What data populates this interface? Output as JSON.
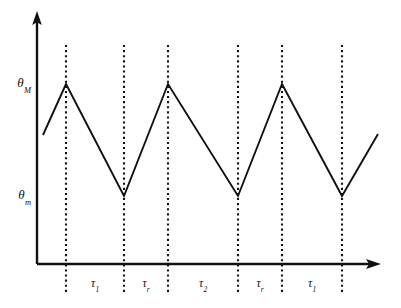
{
  "figure": {
    "background_color": "#ffffff",
    "ink_color": "#111111",
    "width": 401,
    "height": 308
  },
  "axes": {
    "y_axis": {
      "name": "vertical-axis",
      "has_arrow": true,
      "x": 37,
      "y_top": 12,
      "y_bottom": 264
    },
    "x_axis": {
      "name": "horizontal-axis",
      "has_arrow": true,
      "y": 264,
      "x_left": 37,
      "x_right": 380
    },
    "y_tick_labels": [
      {
        "text": "θ",
        "subscript": "M",
        "value_y": 84
      },
      {
        "text": "θ",
        "subscript": "m",
        "value_y": 196
      }
    ]
  },
  "gridlines": {
    "style": "dotted",
    "y_top": 45,
    "y_bottom": 292,
    "x_positions": [
      66,
      124,
      168,
      238,
      282,
      342
    ]
  },
  "interval_labels": [
    {
      "text": "τ",
      "subscript": "1",
      "center_x": 95,
      "y": 285
    },
    {
      "text": "τ",
      "subscript": "r",
      "center_x": 146,
      "y": 285
    },
    {
      "text": "τ",
      "subscript": "2",
      "center_x": 203,
      "y": 285
    },
    {
      "text": "τ",
      "subscript": "r",
      "center_x": 260,
      "y": 285
    },
    {
      "text": "τ",
      "subscript": "1",
      "center_x": 312,
      "y": 285
    }
  ],
  "chart_data": {
    "type": "line",
    "title": "",
    "xlabel": "",
    "ylabel": "",
    "grid": true,
    "legend": null,
    "series": [
      {
        "name": "temperature-cycle",
        "points": [
          {
            "x": 43,
            "y": 135
          },
          {
            "x": 66,
            "y": 84
          },
          {
            "x": 124,
            "y": 196
          },
          {
            "x": 168,
            "y": 84
          },
          {
            "x": 238,
            "y": 196
          },
          {
            "x": 282,
            "y": 84
          },
          {
            "x": 342,
            "y": 196
          },
          {
            "x": 378,
            "y": 134
          }
        ]
      }
    ],
    "y_levels": {
      "theta_M": {
        "label": "θ_M",
        "pixel_y": 84,
        "role": "upper-limit"
      },
      "theta_m": {
        "label": "θ_m",
        "pixel_y": 196,
        "role": "lower-limit"
      }
    },
    "x_intervals": [
      {
        "label": "τ_1",
        "from_x": 66,
        "to_x": 124
      },
      {
        "label": "τ_r",
        "from_x": 124,
        "to_x": 168
      },
      {
        "label": "τ_2",
        "from_x": 168,
        "to_x": 238
      },
      {
        "label": "τ_r",
        "from_x": 238,
        "to_x": 282
      },
      {
        "label": "τ_1",
        "from_x": 282,
        "to_x": 342
      }
    ],
    "annotations": [
      "Sawtooth temperature profile oscillating between θ_m and θ_M",
      "Heating ramps up to θ_M, cooling ramps down to θ_m"
    ]
  }
}
